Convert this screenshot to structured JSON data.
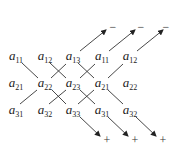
{
  "diagram": {
    "title": "",
    "rows": [
      [
        {
          "base": "a",
          "sub": "11"
        },
        {
          "base": "a",
          "sub": "12"
        },
        {
          "base": "a",
          "sub": "13"
        },
        {
          "base": "a",
          "sub": "11"
        },
        {
          "base": "a",
          "sub": "12"
        }
      ],
      [
        {
          "base": "a",
          "sub": "21"
        },
        {
          "base": "a",
          "sub": "22"
        },
        {
          "base": "a",
          "sub": "23"
        },
        {
          "base": "a",
          "sub": "21"
        },
        {
          "base": "a",
          "sub": "22"
        }
      ],
      [
        {
          "base": "a",
          "sub": "31"
        },
        {
          "base": "a",
          "sub": "32"
        },
        {
          "base": "a",
          "sub": "33"
        },
        {
          "base": "a",
          "sub": "31"
        },
        {
          "base": "a",
          "sub": "32"
        }
      ]
    ],
    "minus_signs": [
      "−",
      "−",
      "−"
    ],
    "plus_signs": [
      "+",
      "+",
      "+"
    ]
  }
}
